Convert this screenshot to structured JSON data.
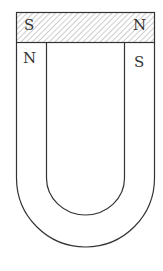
{
  "diagram": {
    "keeper": {
      "left_label": "S",
      "right_label": "N",
      "pattern": "hatched"
    },
    "poles": {
      "left_label": "N",
      "right_label": "S"
    },
    "colors": {
      "stroke": "#333333",
      "hatch": "#888888",
      "background": "#ffffff"
    }
  }
}
